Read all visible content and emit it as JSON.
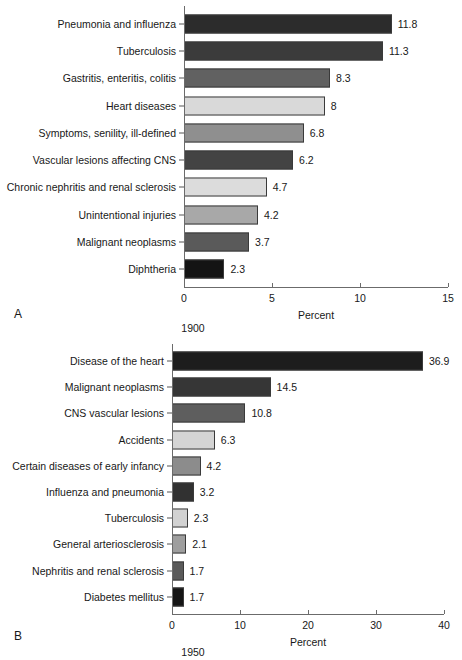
{
  "figure": {
    "panel_a_letter": "A",
    "panel_b_letter": "B",
    "panel_a_year": "1900",
    "panel_b_year": "1950"
  },
  "chart_data": [
    {
      "type": "bar",
      "orientation": "horizontal",
      "panel": "A",
      "title": "1900",
      "xlabel": "Percent",
      "ylabel": "",
      "xlim": [
        0,
        15
      ],
      "xticks": [
        0,
        5,
        10,
        15
      ],
      "xticklabels": [
        "0",
        "5",
        "10",
        "15"
      ],
      "grid": false,
      "legend": "none",
      "categories": [
        "Pneumonia and influenza",
        "Tuberculosis",
        "Gastritis, enteritis, colitis",
        "Heart diseases",
        "Symptoms, senility, ill-defined",
        "Vascular lesions affecting CNS",
        "Chronic nephritis and renal sclerosis",
        "Unintentional injuries",
        "Malignant neoplasms",
        "Diphtheria"
      ],
      "values": [
        11.8,
        11.3,
        8.3,
        8,
        6.8,
        6.2,
        4.7,
        4.2,
        3.7,
        2.3
      ],
      "value_labels": [
        "11.8",
        "11.3",
        "8.3",
        "8",
        "6.8",
        "6.2",
        "4.7",
        "4.2",
        "3.7",
        "2.3"
      ],
      "bar_colors": [
        "#2c2c2c",
        "#3b3b3b",
        "#616161",
        "#d9d9d9",
        "#8f8f8f",
        "#434343",
        "#dcdcdc",
        "#a8a8a8",
        "#5a5a5a",
        "#141414"
      ]
    },
    {
      "type": "bar",
      "orientation": "horizontal",
      "panel": "B",
      "title": "1950",
      "xlabel": "Percent",
      "ylabel": "",
      "xlim": [
        0,
        40
      ],
      "xticks": [
        0,
        10,
        20,
        30,
        40
      ],
      "xticklabels": [
        "0",
        "10",
        "20",
        "30",
        "40"
      ],
      "grid": false,
      "legend": "none",
      "categories": [
        "Disease of the heart",
        "Malignant neoplasms",
        "CNS vascular lesions",
        "Accidents",
        "Certain diseases of early infancy",
        "Influenza and pneumonia",
        "Tuberculosis",
        "General arteriosclerosis",
        "Nephritis and renal sclerosis",
        "Diabetes mellitus"
      ],
      "values": [
        36.9,
        14.5,
        10.8,
        6.3,
        4.2,
        3.2,
        2.3,
        2.1,
        1.7,
        1.7
      ],
      "value_labels": [
        "36.9",
        "14.5",
        "10.8",
        "6.3",
        "4.2",
        "3.2",
        "2.3",
        "2.1",
        "1.7",
        "1.7"
      ],
      "bar_colors": [
        "#1d1d1d",
        "#363636",
        "#5e5e5e",
        "#d4d4d4",
        "#8c8c8c",
        "#313131",
        "#d2d2d2",
        "#9e9e9e",
        "#5a5a5a",
        "#151515"
      ]
    }
  ]
}
